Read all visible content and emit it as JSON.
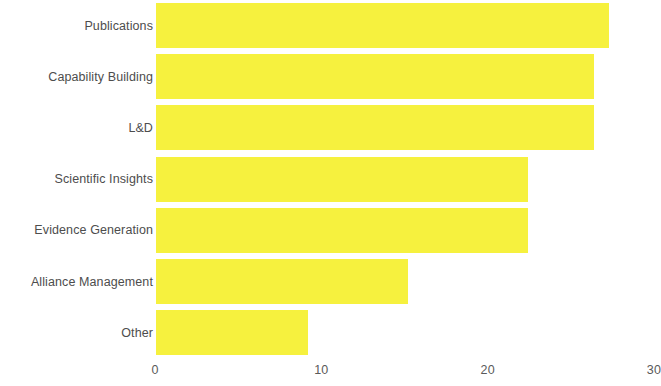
{
  "chart_data": {
    "type": "bar",
    "orientation": "horizontal",
    "title": "",
    "subtitle": "",
    "xlabel": "",
    "ylabel": "",
    "categories": [
      "Publications",
      "Capability Building",
      "L&D",
      "Scientific Insights",
      "Evidence Generation",
      "Alliance Management",
      "Other"
    ],
    "values": [
      27.3,
      26.4,
      26.4,
      22.4,
      22.4,
      15.2,
      9.2
    ],
    "series": [
      {
        "name": "",
        "values": [
          27.3,
          26.4,
          26.4,
          22.4,
          22.4,
          15.2,
          9.2
        ]
      }
    ],
    "xlim": [
      0,
      30
    ],
    "xticks": [
      0,
      10,
      20,
      30
    ],
    "xtick_labels": [
      "0",
      "10",
      "20",
      "30"
    ],
    "bar_color": "#f6f13e",
    "label_color": "#4d4d4d",
    "tick_color": "#5a5a5a",
    "background_color": "#ffffff",
    "grid": false,
    "legend": false,
    "legend_position": "none",
    "axis_line": false,
    "annotations": []
  }
}
